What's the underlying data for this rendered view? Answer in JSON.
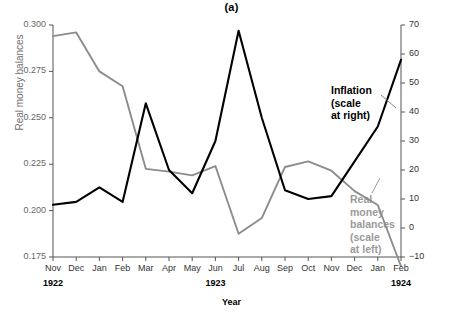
{
  "figure": {
    "title": "(a)",
    "xlabel": "Year",
    "ylabel_left": "Real money balances",
    "ylabel_right": "Monthly inflation rate (percent)"
  },
  "annotations": {
    "inflation": [
      "Inflation",
      "(scale",
      "at right)"
    ],
    "money": [
      "Real",
      "money",
      "balances",
      "(scale",
      "at left)"
    ]
  },
  "axes": {
    "left_ticks": [
      "0.300",
      "0.275",
      "0.250",
      "0.225",
      "0.200",
      "0.175"
    ],
    "right_ticks": [
      "70",
      "60",
      "50",
      "40",
      "30",
      "20",
      "10",
      "0",
      "−10"
    ],
    "x_ticks": [
      "Nov",
      "Dec",
      "Jan",
      "Feb",
      "Mar",
      "Apr",
      "May",
      "Jun",
      "Jul",
      "Aug",
      "Sep",
      "Oct",
      "Nov",
      "Dec",
      "Jan",
      "Feb"
    ],
    "year_ticks": [
      {
        "label": "1922",
        "index": 0
      },
      {
        "label": "1923",
        "index": 7
      },
      {
        "label": "1924",
        "index": 15
      }
    ]
  },
  "colors": {
    "inflation": "#000000",
    "money": "#8c8c8c",
    "axis": "#555555"
  },
  "chart_data": {
    "type": "line",
    "title": "(a)",
    "xlabel": "Year",
    "grid": false,
    "legend": "inline-annotations",
    "categories": [
      "Nov 1922",
      "Dec 1922",
      "Jan 1923",
      "Feb 1923",
      "Mar 1923",
      "Apr 1923",
      "May 1923",
      "Jun 1923",
      "Jul 1923",
      "Aug 1923",
      "Sep 1923",
      "Oct 1923",
      "Nov 1923",
      "Dec 1923",
      "Jan 1924",
      "Feb 1924"
    ],
    "x_tick_labels": [
      "Nov",
      "Dec",
      "Jan",
      "Feb",
      "Mar",
      "Apr",
      "May",
      "Jun",
      "Jul",
      "Aug",
      "Sep",
      "Oct",
      "Nov",
      "Dec",
      "Jan",
      "Feb"
    ],
    "series": [
      {
        "name": "Real money balances (scale at left)",
        "axis": "left",
        "color": "#8c8c8c",
        "ylabel": "Real money balances",
        "ylim": [
          0.175,
          0.3
        ],
        "yticks": [
          0.175,
          0.2,
          0.225,
          0.25,
          0.275,
          0.3
        ],
        "values": [
          0.294,
          0.296,
          0.275,
          0.267,
          0.2225,
          0.221,
          0.219,
          0.224,
          0.1875,
          0.196,
          0.2235,
          0.2265,
          0.2215,
          0.2105,
          0.203,
          0.17
        ]
      },
      {
        "name": "Inflation (scale at right)",
        "axis": "right",
        "color": "#000000",
        "ylabel": "Monthly inflation rate (percent)",
        "ylim": [
          -10,
          70
        ],
        "yticks": [
          -10,
          0,
          10,
          20,
          30,
          40,
          50,
          60,
          70
        ],
        "values": [
          8,
          9,
          14,
          9,
          43,
          20,
          12,
          30,
          68,
          38,
          13,
          10,
          11,
          23,
          35,
          58
        ]
      }
    ]
  }
}
